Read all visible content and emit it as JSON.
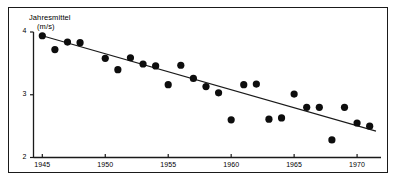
{
  "figure": {
    "name": "annual-mean-wind-speed-scatter",
    "background_color": "#ffffff",
    "frame_color": "#1a1a1a",
    "marker_color": "#0d0d0d",
    "line_color": "#1a1a1a"
  },
  "chart_data": {
    "type": "scatter",
    "title": "",
    "subtitle": "",
    "xlabel": "",
    "ylabel": "Jahresmittel (m/s)",
    "ylabel_lines": [
      "Jahresmittel",
      "(m/s)"
    ],
    "grid": false,
    "legend": null,
    "xlim": [
      1944.3,
      1971.9
    ],
    "ylim": [
      2,
      4
    ],
    "xticks": [
      1945,
      1950,
      1955,
      1960,
      1965,
      1970
    ],
    "xtick_labels": [
      "1945",
      "1950",
      "1955",
      "1960",
      "1965",
      "1970"
    ],
    "yticks": [
      2,
      3,
      4
    ],
    "ytick_labels": [
      "2",
      "3",
      "4"
    ],
    "x": [
      1945,
      1946,
      1947,
      1948,
      1950,
      1951,
      1952,
      1953,
      1954,
      1955,
      1956,
      1957,
      1958,
      1959,
      1960,
      1961,
      1962,
      1963,
      1964,
      1965,
      1966,
      1967,
      1968,
      1969,
      1970,
      1971
    ],
    "values": [
      3.94,
      3.72,
      3.84,
      3.83,
      3.58,
      3.4,
      3.59,
      3.49,
      3.46,
      3.16,
      3.47,
      3.26,
      3.13,
      3.03,
      2.6,
      3.16,
      3.17,
      2.61,
      2.63,
      3.01,
      2.8,
      2.8,
      2.28,
      2.8,
      2.55,
      2.5
    ],
    "series": [
      {
        "name": "Jahresmittel",
        "marker": "filled-circle",
        "x": [
          1945,
          1946,
          1947,
          1948,
          1950,
          1951,
          1952,
          1953,
          1954,
          1955,
          1956,
          1957,
          1958,
          1959,
          1960,
          1961,
          1962,
          1963,
          1964,
          1965,
          1966,
          1967,
          1968,
          1969,
          1970,
          1971
        ],
        "values": [
          3.94,
          3.72,
          3.84,
          3.83,
          3.58,
          3.4,
          3.59,
          3.49,
          3.46,
          3.16,
          3.47,
          3.26,
          3.13,
          3.03,
          2.6,
          3.16,
          3.17,
          2.61,
          2.63,
          3.01,
          2.8,
          2.8,
          2.28,
          2.8,
          2.55,
          2.5
        ]
      },
      {
        "name": "Trendlinie",
        "type": "trend-line",
        "x": [
          1945,
          1971.5
        ],
        "values": [
          3.94,
          2.42
        ]
      }
    ]
  }
}
